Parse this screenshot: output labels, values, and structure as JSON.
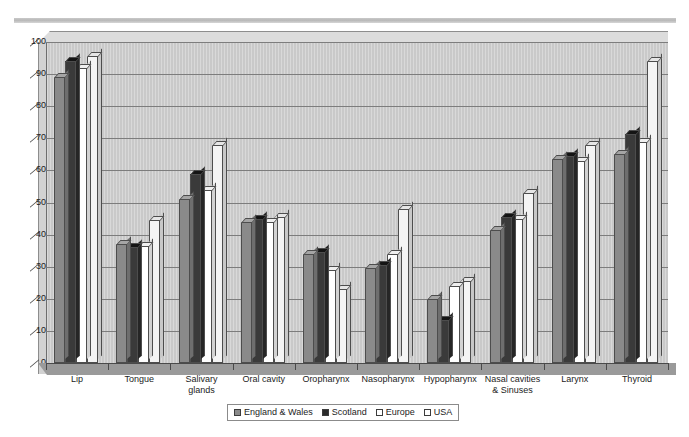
{
  "chart_data": {
    "type": "bar",
    "title": "",
    "subtitle": "",
    "xlabel": "",
    "ylabel": "",
    "ylim": [
      0,
      100
    ],
    "yticks": [
      0,
      10,
      20,
      30,
      40,
      50,
      60,
      70,
      80,
      90,
      100
    ],
    "grid": true,
    "legend_position": "bottom",
    "style": "3d-clustered-column",
    "categories": [
      "Lip",
      "Tongue",
      "Salivary glands",
      "Oral cavity",
      "Oropharynx",
      "Nasopharynx",
      "Hypopharynx",
      "Nasal cavities & Sinuses",
      "Larynx",
      "Thyroid"
    ],
    "category_lines": [
      [
        "Lip"
      ],
      [
        "Tongue"
      ],
      [
        "Salivary",
        "glands"
      ],
      [
        "Oral cavity"
      ],
      [
        "Oropharynx"
      ],
      [
        "Nasopharynx"
      ],
      [
        "Hypopharynx"
      ],
      [
        "Nasal cavities",
        "& Sinuses"
      ],
      [
        "Larynx"
      ],
      [
        "Thyroid"
      ]
    ],
    "series": [
      {
        "name": "England & Wales",
        "color": "#8a8a8a",
        "values": [
          89,
          37,
          51,
          44,
          34,
          29.5,
          20,
          41.5,
          63.5,
          65
        ]
      },
      {
        "name": "Scotland",
        "color": "#2b2b2b",
        "values": [
          94,
          36,
          59,
          45,
          34.5,
          30.5,
          13.5,
          45.5,
          64.5,
          71.5
        ]
      },
      {
        "name": "Europe",
        "color": "#ffffff",
        "values": [
          92,
          36.5,
          54,
          44,
          29,
          34,
          24,
          45,
          63,
          69
        ]
      },
      {
        "name": "USA",
        "color": "#f4f4f4",
        "values": [
          95.5,
          44.5,
          68,
          45.5,
          23,
          48,
          25.5,
          53,
          68,
          94
        ]
      }
    ]
  },
  "legend": {
    "items": [
      {
        "label": "England & Wales"
      },
      {
        "label": "Scotland"
      },
      {
        "label": "Europe"
      },
      {
        "label": "USA"
      }
    ]
  }
}
